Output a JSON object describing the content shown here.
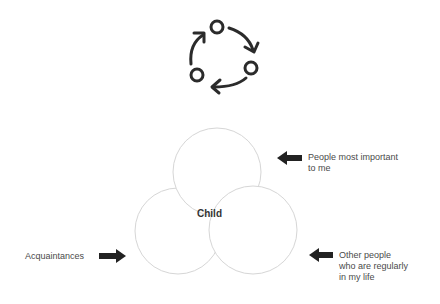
{
  "icon": {
    "name": "cycle-icon",
    "color": "#2b2b2b"
  },
  "diagram": {
    "center_label": "Child",
    "circles": [
      {
        "id": "top",
        "meaning": "People most important to me"
      },
      {
        "id": "bottom-left",
        "meaning": "Acquaintances"
      },
      {
        "id": "bottom-right",
        "meaning": "Other people who are regularly in my life"
      }
    ],
    "circle_stroke": "#d6d6d6",
    "arrow_color": "#222222"
  },
  "labels": {
    "top_right": "People most important\nto me",
    "bottom_right": "Other people\nwho are regularly\nin my life",
    "left": "Acquaintances"
  }
}
